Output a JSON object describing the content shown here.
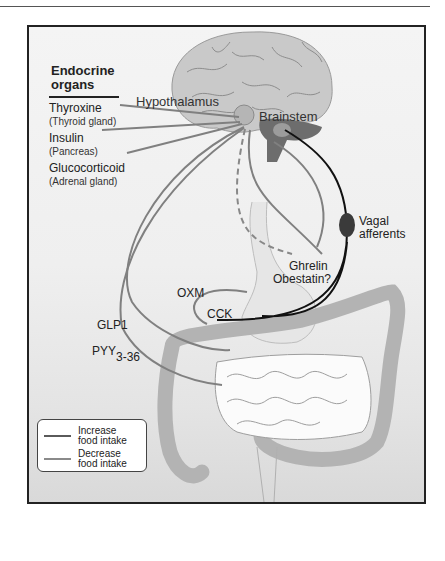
{
  "figure": {
    "title": {
      "line1": "Endocrine",
      "line2": "organs"
    },
    "endocrine_organs": [
      {
        "hormone": "Thyroxine",
        "organ": "(Thyroid gland)"
      },
      {
        "hormone": "Insulin",
        "organ": "(Pancreas)"
      },
      {
        "hormone": "Glucocorticoid",
        "organ": "(Adrenal gland)"
      }
    ],
    "brain_regions": {
      "hypothalamus": "Hypothalamus",
      "brainstem": "Brainstem"
    },
    "nerve": {
      "line1": "Vagal",
      "line2": "afferents"
    },
    "gut_hormones": {
      "ghrelin": "Ghrelin",
      "obestatin": "Obestatin?",
      "oxm": "OXM",
      "cck": "CCK",
      "glp1": "GLP1",
      "pyy": "PYY",
      "pyy_sub": "3-36"
    },
    "legend": [
      {
        "line1": "Increase",
        "line2": "food intake",
        "color": "#5a5a5a"
      },
      {
        "line1": "Decrease",
        "line2": "food intake",
        "color": "#8a8a8a"
      }
    ]
  }
}
